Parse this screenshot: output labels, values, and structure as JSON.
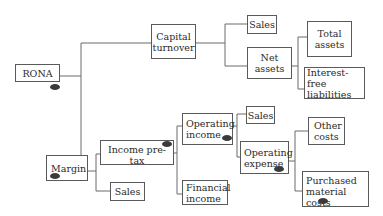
{
  "diagram": {
    "type": "tree",
    "nodes": {
      "rona": {
        "label": "RONA",
        "lines": [
          "RONA"
        ]
      },
      "capital_turnover": {
        "label": "Capital turnover",
        "lines": [
          "Capital",
          "turnover"
        ]
      },
      "sales_top": {
        "label": "Sales",
        "lines": [
          "Sales"
        ]
      },
      "net_assets": {
        "label": "Net assets",
        "lines": [
          "Net",
          "assets"
        ]
      },
      "total_assets": {
        "label": "Total assets",
        "lines": [
          "Total",
          "assets"
        ]
      },
      "interest_free_liabilities": {
        "label": "Interest-free liabilities",
        "lines": [
          "Interest-free",
          "liabilities"
        ]
      },
      "margin": {
        "label": "Margin",
        "lines": [
          "Margin"
        ]
      },
      "income_pre_tax": {
        "label": "Income pre-tax",
        "lines": [
          "Income pre-tax"
        ]
      },
      "sales_bottom": {
        "label": "Sales",
        "lines": [
          "Sales"
        ]
      },
      "operating_income": {
        "label": "Operating income",
        "lines": [
          "Operating",
          "income"
        ]
      },
      "financial_income": {
        "label": "Financial income",
        "lines": [
          "Financial",
          "income"
        ]
      },
      "sales_mid": {
        "label": "Sales",
        "lines": [
          "Sales"
        ]
      },
      "operating_expense": {
        "label": "Operating expense",
        "lines": [
          "Operating",
          "expense"
        ]
      },
      "other_costs": {
        "label": "Other costs",
        "lines": [
          "Other",
          "costs"
        ]
      },
      "purchased_material_costs": {
        "label": "Purchased material costs",
        "lines": [
          "Purchased",
          "material costs"
        ]
      }
    },
    "edges": [
      [
        "rona",
        "capital_turnover"
      ],
      [
        "rona",
        "margin"
      ],
      [
        "capital_turnover",
        "sales_top"
      ],
      [
        "capital_turnover",
        "net_assets"
      ],
      [
        "net_assets",
        "total_assets"
      ],
      [
        "net_assets",
        "interest_free_liabilities"
      ],
      [
        "margin",
        "income_pre_tax"
      ],
      [
        "margin",
        "sales_bottom"
      ],
      [
        "income_pre_tax",
        "operating_income"
      ],
      [
        "income_pre_tax",
        "financial_income"
      ],
      [
        "operating_income",
        "sales_mid"
      ],
      [
        "operating_income",
        "operating_expense"
      ],
      [
        "operating_expense",
        "other_costs"
      ],
      [
        "operating_expense",
        "purchased_material_costs"
      ]
    ],
    "marked_nodes": [
      "rona",
      "margin",
      "income_pre_tax",
      "operating_income",
      "operating_expense",
      "purchased_material_costs"
    ],
    "colors": {
      "line": "#5a5a5a",
      "marker": "#3a3a3a",
      "text": "#2a2a2a"
    }
  }
}
